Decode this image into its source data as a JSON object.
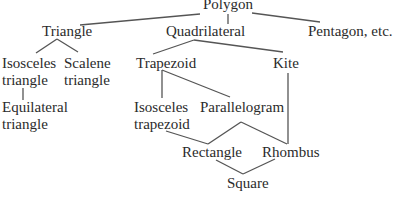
{
  "diagram": {
    "type": "hierarchy-tree",
    "nodes": {
      "polygon": {
        "line1": "Polygon"
      },
      "triangle": {
        "line1": "Triangle"
      },
      "quadrilateral": {
        "line1": "Quadrilateral"
      },
      "pentagon": {
        "line1": "Pentagon, etc."
      },
      "isosceles_triangle": {
        "line1": "Isosceles",
        "line2": "triangle"
      },
      "scalene_triangle": {
        "line1": "Scalene",
        "line2": "triangle"
      },
      "equilateral_triangle": {
        "line1": "Equilateral",
        "line2": "triangle"
      },
      "trapezoid": {
        "line1": "Trapezoid"
      },
      "kite": {
        "line1": "Kite"
      },
      "isosceles_trapezoid": {
        "line1": "Isosceles",
        "line2": "trapezoid"
      },
      "parallelogram": {
        "line1": "Parallelogram"
      },
      "rectangle": {
        "line1": "Rectangle"
      },
      "rhombus": {
        "line1": "Rhombus"
      },
      "square": {
        "line1": "Square"
      }
    },
    "edges": [
      [
        "Polygon",
        "Triangle"
      ],
      [
        "Polygon",
        "Quadrilateral"
      ],
      [
        "Polygon",
        "Pentagon, etc."
      ],
      [
        "Triangle",
        "Isosceles triangle"
      ],
      [
        "Triangle",
        "Scalene triangle"
      ],
      [
        "Isosceles triangle",
        "Equilateral triangle"
      ],
      [
        "Quadrilateral",
        "Trapezoid"
      ],
      [
        "Quadrilateral",
        "Kite"
      ],
      [
        "Trapezoid",
        "Isosceles trapezoid"
      ],
      [
        "Trapezoid",
        "Parallelogram"
      ],
      [
        "Isosceles trapezoid",
        "Rectangle"
      ],
      [
        "Parallelogram",
        "Rectangle"
      ],
      [
        "Parallelogram",
        "Rhombus"
      ],
      [
        "Kite",
        "Rhombus"
      ],
      [
        "Rectangle",
        "Square"
      ],
      [
        "Rhombus",
        "Square"
      ]
    ],
    "colors": {
      "text": "#2b2b2b",
      "line": "#555555",
      "background": "#ffffff"
    }
  }
}
